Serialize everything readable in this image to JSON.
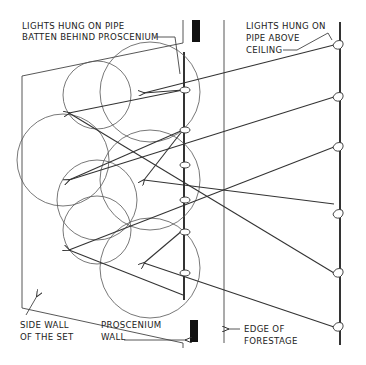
{
  "diagram": {
    "labels": {
      "batten_behind": [
        "LIGHTS HUNG ON PIPE",
        "BATTEN BEHIND PROSCENIUM"
      ],
      "pipe_above": [
        "LIGHTS HUNG ON",
        "PIPE ABOVE",
        "CEILING"
      ],
      "side_wall": [
        "SIDE WALL",
        "OF THE SET"
      ],
      "proscenium": [
        "PROSCENIUM",
        "WALL"
      ],
      "forestage": [
        "EDGE OF",
        "FORESTAGE"
      ]
    },
    "elements": {
      "set_side_wall": "Trapezoid outline of set side wall on the left",
      "proscenium_wall": "Two dark rectangles (top and bottom) marking the proscenium opening",
      "batten_pipe": "Vertical pipe batten behind proscenium with 6 lights",
      "forestage_edge": "Vertical line marking edge of forestage",
      "ceiling_pipe": "Vertical pipe above ceiling with 5 lights",
      "light_pools": "Overlapping circles representing lit areas",
      "beams": "Lines with arrowheads from lights to focus points"
    },
    "colors": {
      "ink": "#333333",
      "background": "#ffffff"
    }
  }
}
